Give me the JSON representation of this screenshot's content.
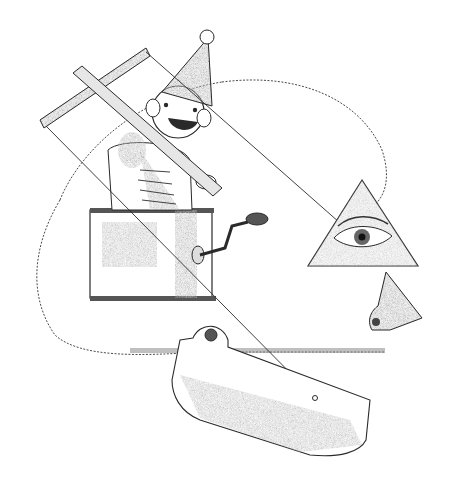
{
  "illustration": {
    "title": "Pencil sketch: jack-in-the-box puppet inside a head profile",
    "colors": {
      "background": "#ffffff",
      "ink": "#2a2a2a",
      "line": "#3a3a3a",
      "shade_dark": "#6b6b6b",
      "shade_mid": "#9a9a9a",
      "shade_light": "#cfcfcf"
    },
    "elements": [
      {
        "name": "head-profile-outline",
        "description": "Large dotted head silhouette outline"
      },
      {
        "name": "marionette-control-bar",
        "description": "Cross-shaped wooden puppet control held by jester"
      },
      {
        "name": "jester-puppet",
        "description": "Smiling figure with cone party hat and pompom"
      },
      {
        "name": "jack-in-the-box",
        "description": "Box with side crank handle"
      },
      {
        "name": "eye-triangle",
        "description": "Triangle with an eye, forming the head's eye"
      },
      {
        "name": "nose-piece",
        "description": "Small triangular nose with pivot rivet"
      },
      {
        "name": "jaw-piece",
        "description": "Hinged jaw panel with pivot eyelet"
      },
      {
        "name": "puppet-strings",
        "description": "Straight lines from control bar to eye and jaw"
      }
    ]
  }
}
